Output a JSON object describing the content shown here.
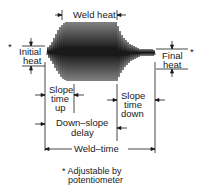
{
  "diagram": {
    "labels": {
      "weld_heat": "Weld heat",
      "initial_heat_1": "Initial",
      "initial_heat_2": "heat",
      "final_heat_1": "Final",
      "final_heat_2": "heat",
      "slope_up_1": "Slope",
      "slope_up_2": "time",
      "slope_up_3": "up",
      "slope_down_1": "Slope",
      "slope_down_2": "time",
      "slope_down_3": "down",
      "downslope_delay_1": "Down–slope",
      "downslope_delay_2": "delay",
      "weld_time": "Weld–time",
      "asterisk_initial": "*",
      "asterisk_final": "*",
      "footnote_1": "* Adjustable by",
      "footnote_2": "potentiometer"
    },
    "line_color": "#1a1a1a"
  }
}
